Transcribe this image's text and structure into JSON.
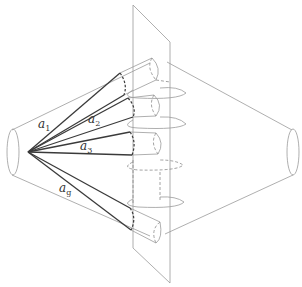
{
  "diagram": {
    "type": "geometric-schematic",
    "labels": [
      {
        "id": "a1",
        "base": "a",
        "sub": "1"
      },
      {
        "id": "a2",
        "base": "a",
        "sub": "2"
      },
      {
        "id": "a3",
        "base": "a",
        "sub": "3"
      },
      {
        "id": "ag",
        "base": "a",
        "sub": "g"
      }
    ],
    "colors": {
      "thin_line": "#9a9a9a",
      "ray_line": "#3a3a3a",
      "background": "#ffffff"
    }
  }
}
